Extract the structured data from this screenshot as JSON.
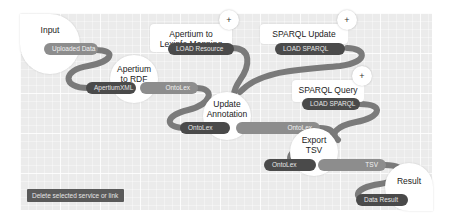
{
  "colors": {
    "canvas_bg": "#ebebeb",
    "link": "#7a7a7a",
    "pill_dark": "#4a4a4a",
    "pill_light": "#8d8d8d",
    "button_bg": "#5a5a5a"
  },
  "nodes": {
    "input": {
      "title": "Input",
      "outputs": [
        "Uploaded Data"
      ]
    },
    "apertium_to_rdf": {
      "title": "Apertium to RDF",
      "inputs": [
        "ApertiumXML"
      ],
      "outputs": [
        "OntoLex"
      ]
    },
    "apertium_to_lexinfo": {
      "title": "Apertium to Lexinfo Mapping",
      "outputs": [
        "LOAD Resource"
      ],
      "plus": "+"
    },
    "sparql_update": {
      "title": "SPARQL Update",
      "outputs": [
        "LOAD SPARQL"
      ],
      "plus": "+"
    },
    "update_annotation": {
      "title": "Update Annotation",
      "inputs": [
        "OntoLex"
      ],
      "outputs": [
        "OntoLex"
      ]
    },
    "sparql_query": {
      "title": "SPARQL Query",
      "outputs": [
        "LOAD SPARQL"
      ],
      "plus": "+"
    },
    "export_tsv": {
      "title": "Export TSV",
      "inputs": [
        "OntoLex"
      ],
      "outputs": [
        "TSV"
      ]
    },
    "result": {
      "title": "Result",
      "inputs": [
        "Data Result"
      ]
    }
  },
  "toolbar": {
    "delete_label": "Delete selected service or link"
  }
}
